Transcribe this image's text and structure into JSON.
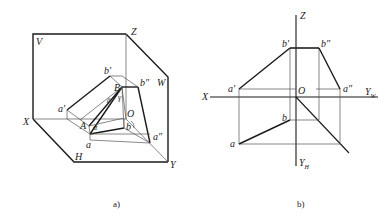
{
  "figure_a": {
    "caption": "a)",
    "labels": {
      "V": "V",
      "Z": "Z",
      "W": "W",
      "X": "X",
      "H": "H",
      "Y": "Y",
      "O": "O",
      "a_prime": "a′",
      "b_prime": "b′",
      "b_double": "b″",
      "a_double": "a″",
      "A": "A",
      "B": "B",
      "a": "a",
      "b": "b",
      "alpha": "α",
      "beta": "β",
      "gamma": "γ"
    }
  },
  "figure_b": {
    "caption": "b)",
    "labels": {
      "Z": "Z",
      "X": "X",
      "O": "O",
      "Y_W": "Y",
      "Y_W_sub": "W",
      "Y_H": "Y",
      "Y_H_sub": "H",
      "a_prime": "a′",
      "b_prime": "b′",
      "b_double": "b″",
      "a_double": "a″",
      "a": "a",
      "b": "b"
    }
  },
  "colors": {
    "line": "#1a1a1a",
    "thin": "#555555",
    "background": "#ffffff"
  }
}
